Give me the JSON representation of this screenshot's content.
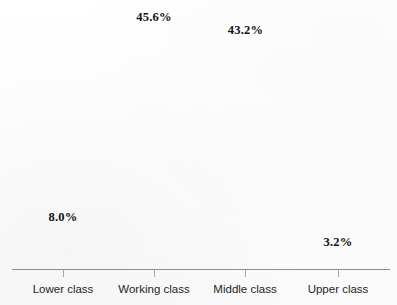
{
  "chart_data": {
    "type": "bar",
    "title": "",
    "subtitle": "",
    "xlabel": "",
    "ylabel": "",
    "categories": [
      "Lower class",
      "Working class",
      "Middle class",
      "Upper class"
    ],
    "values": [
      8.0,
      45.6,
      43.2,
      3.2
    ],
    "value_labels": [
      "8.0%",
      "45.6%",
      "43.2%",
      "3.2%"
    ],
    "unit": "%",
    "ylim": [
      0,
      50
    ],
    "grid": false,
    "legend": false,
    "legend_position": "none",
    "annotations": [],
    "series": [
      {
        "name": "Share of population",
        "values": [
          8.0,
          45.6,
          43.2,
          3.2
        ],
        "labels": [
          "8.0%",
          "45.6%",
          "43.2%",
          "3.2%"
        ],
        "colors": [
          "#0d0d0d",
          "#9a9a9a",
          "#e2e2e2",
          "#2b2b2b"
        ]
      }
    ],
    "bars": [
      {
        "category": "Lower class",
        "value": 8.0,
        "label": "8.0%",
        "color": "#0d0d0d"
      },
      {
        "category": "Working class",
        "value": 45.6,
        "label": "45.6%",
        "color": "#9a9a9a"
      },
      {
        "category": "Middle class",
        "value": 43.2,
        "label": "43.2%",
        "color": "#e2e2e2"
      },
      {
        "category": "Upper class",
        "value": 3.2,
        "label": "3.2%",
        "color": "#2b2b2b"
      }
    ]
  },
  "axis": {
    "baseline_color": "#8e8e8e",
    "tick_color": "#a8a8a8"
  },
  "page": {
    "background_color": "#fdfdfd",
    "value_label_color": "#121212",
    "category_label_color": "#1f1f1f"
  }
}
